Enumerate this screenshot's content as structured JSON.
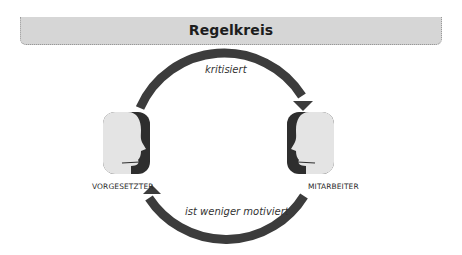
{
  "title": "Regelkreis",
  "nodes": [
    {
      "id": "vorgesetzter",
      "label": "VORGESETZTER",
      "icon": "head-profile-facing-right-icon"
    },
    {
      "id": "mitarbeiter",
      "label": "MITARBEITER",
      "icon": "head-profile-facing-left-icon"
    }
  ],
  "edges": [
    {
      "from": "vorgesetzter",
      "to": "mitarbeiter",
      "label": "kritisiert"
    },
    {
      "from": "mitarbeiter",
      "to": "vorgesetzter",
      "label": "ist weniger motiviert"
    }
  ],
  "colors": {
    "banner": "#d6d6d6",
    "arrow": "#3c3c3c",
    "face_light": "#e4e4e4",
    "face_dark": "#2e2e2e"
  }
}
